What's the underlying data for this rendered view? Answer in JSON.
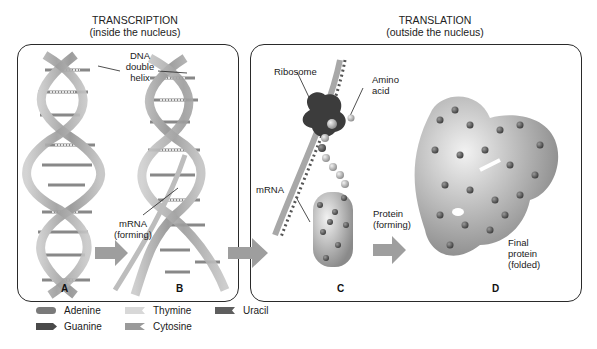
{
  "sections": {
    "transcription": {
      "title": "TRANSCRIPTION",
      "subtitle": "(inside the nucleus)"
    },
    "translation": {
      "title": "TRANSLATION",
      "subtitle": "(outside the nucleus)"
    }
  },
  "labels": {
    "dna_line1": "DNA",
    "dna_line2": "double",
    "dna_line3": "helix",
    "mrna_forming_line1": "mRNA",
    "mrna_forming_line2": "(forming)",
    "ribosome": "Ribosome",
    "amino_line1": "Amino",
    "amino_line2": "acid",
    "mrna": "mRNA",
    "protein_forming_line1": "Protein",
    "protein_forming_line2": "(forming)",
    "final_line1": "Final",
    "final_line2": "protein",
    "final_line3": "(folded)"
  },
  "steps": {
    "a": "A",
    "b": "B",
    "c": "C",
    "d": "D"
  },
  "legend": [
    {
      "name": "Adenine",
      "color": "#7a7a7a",
      "shape": "rounded"
    },
    {
      "name": "Thymine",
      "color": "#d8d8d8",
      "shape": "notched"
    },
    {
      "name": "Uracil",
      "color": "#5e5e5e",
      "shape": "notched"
    },
    {
      "name": "Guanine",
      "color": "#4a4a4a",
      "shape": "arrow"
    },
    {
      "name": "Cytosine",
      "color": "#9a9a9a",
      "shape": "notched"
    }
  ],
  "colors": {
    "backbone": "#a9a9a9",
    "arrow": "#9e9e9e",
    "ribosome": "#3c3c3c",
    "panel_border": "#2a2a2a"
  }
}
